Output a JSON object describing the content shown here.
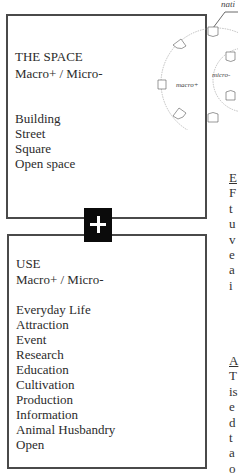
{
  "diagram": {
    "label_top": "nati",
    "outer_label": "macro+",
    "inner_label": "micro-"
  },
  "space_box": {
    "title": "THE SPACE",
    "subtitle": "Macro+ / Micro-",
    "items": [
      "Building",
      "Street",
      "Square",
      "Open space"
    ]
  },
  "connector": {
    "icon": "plus-icon",
    "symbol": "+"
  },
  "use_box": {
    "title": "USE",
    "subtitle": "Macro+ / Micro-",
    "items": [
      "Everyday Life",
      "Attraction",
      "Event",
      "Research",
      "Education",
      "Cultivation",
      "Production",
      "Information",
      "Animal Husbandry",
      "Open"
    ]
  },
  "side_text": {
    "block1": [
      "E",
      "F",
      "t",
      "u",
      "v",
      "e",
      "a",
      "i"
    ],
    "block2": [
      "A",
      "T",
      "is",
      "e",
      "d",
      "t",
      "a",
      "o"
    ]
  }
}
